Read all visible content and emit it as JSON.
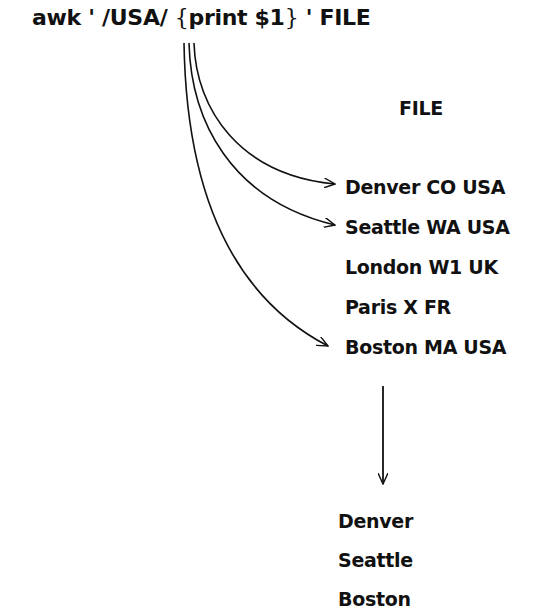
{
  "command": {
    "prefix": "awk ' /USA/ ",
    "open_brace": "{",
    "action": "print $1",
    "close_brace": "}",
    "suffix": " ' FILE"
  },
  "file": {
    "title": "FILE",
    "records": [
      {
        "text": "Denver CO USA",
        "matched": true
      },
      {
        "text": "Seattle WA USA",
        "matched": true
      },
      {
        "text": "London W1 UK",
        "matched": false
      },
      {
        "text": "Paris X FR",
        "matched": false
      },
      {
        "text": "Boston MA USA",
        "matched": true
      }
    ]
  },
  "output": {
    "lines": [
      "Denver",
      "Seattle",
      "Boston"
    ]
  },
  "colors": {
    "ink": "#111111",
    "background": "#ffffff"
  }
}
